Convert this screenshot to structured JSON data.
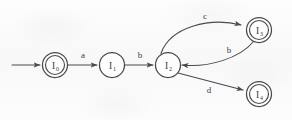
{
  "diagram": {
    "type": "finite-state-automaton",
    "background_color": "#fbfbfb",
    "stroke_color": "#4a4a4e",
    "states": [
      {
        "id": "I0",
        "label_base": "I",
        "label_sub": "0",
        "accepting": true,
        "start": true,
        "cx": 55,
        "cy": 65,
        "r": 12.5
      },
      {
        "id": "I1",
        "label_base": "I",
        "label_sub": "1",
        "accepting": false,
        "start": false,
        "cx": 112,
        "cy": 65,
        "r": 12.5
      },
      {
        "id": "I2",
        "label_base": "I",
        "label_sub": "2",
        "accepting": false,
        "start": false,
        "cx": 168,
        "cy": 65,
        "r": 12.5
      },
      {
        "id": "I3",
        "label_base": "I",
        "label_sub": "3",
        "accepting": true,
        "start": false,
        "cx": 259,
        "cy": 30,
        "r": 12.5
      },
      {
        "id": "I4",
        "label_base": "I",
        "label_sub": "4",
        "accepting": true,
        "start": false,
        "cx": 259,
        "cy": 94,
        "r": 12.5
      }
    ],
    "start_arrow": {
      "label": "start-transition",
      "x1": 12,
      "y1": 65,
      "x2": 40,
      "y2": 65
    },
    "transitions": [
      {
        "id": "t-a",
        "from": "I0",
        "to": "I1",
        "symbol": "a",
        "shape": "straight",
        "label_x": 83,
        "label_y": 58
      },
      {
        "id": "t-b1",
        "from": "I1",
        "to": "I2",
        "symbol": "b",
        "shape": "straight",
        "label_x": 140,
        "label_y": 58
      },
      {
        "id": "t-c",
        "from": "I2",
        "to": "I3",
        "symbol": "c",
        "shape": "curve-upper",
        "label_x": 205,
        "label_y": 19
      },
      {
        "id": "t-b2",
        "from": "I3",
        "to": "I2",
        "symbol": "b",
        "shape": "curve-lower",
        "label_x": 229,
        "label_y": 53
      },
      {
        "id": "t-d",
        "from": "I2",
        "to": "I4",
        "symbol": "d",
        "shape": "straight",
        "label_x": 209,
        "label_y": 93
      }
    ]
  }
}
